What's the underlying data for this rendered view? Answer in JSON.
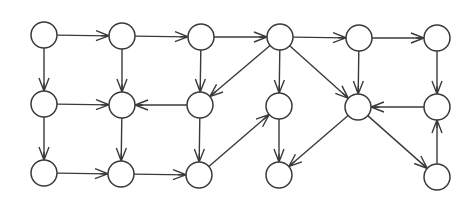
{
  "diagram": {
    "type": "directed-graph",
    "node_radius": 13,
    "colors": {
      "stroke": "#3a3a3a",
      "fill": "#ffffff",
      "background": "#ffffff"
    },
    "nodes": [
      {
        "id": "A",
        "x": 44,
        "y": 35
      },
      {
        "id": "B",
        "x": 122,
        "y": 36
      },
      {
        "id": "C",
        "x": 201,
        "y": 37
      },
      {
        "id": "D",
        "x": 280,
        "y": 37
      },
      {
        "id": "E",
        "x": 359,
        "y": 38
      },
      {
        "id": "F",
        "x": 437,
        "y": 38
      },
      {
        "id": "G",
        "x": 44,
        "y": 104
      },
      {
        "id": "H",
        "x": 122,
        "y": 105
      },
      {
        "id": "I",
        "x": 200,
        "y": 105
      },
      {
        "id": "J",
        "x": 279,
        "y": 106
      },
      {
        "id": "K",
        "x": 358,
        "y": 107
      },
      {
        "id": "L",
        "x": 437,
        "y": 107
      },
      {
        "id": "M",
        "x": 44,
        "y": 173
      },
      {
        "id": "N",
        "x": 121,
        "y": 174
      },
      {
        "id": "O",
        "x": 199,
        "y": 175
      },
      {
        "id": "P",
        "x": 279,
        "y": 175
      },
      {
        "id": "Q",
        "x": 437,
        "y": 177
      }
    ],
    "edges": [
      {
        "from": "A",
        "to": "B"
      },
      {
        "from": "B",
        "to": "C"
      },
      {
        "from": "C",
        "to": "D"
      },
      {
        "from": "D",
        "to": "E"
      },
      {
        "from": "E",
        "to": "F"
      },
      {
        "from": "A",
        "to": "G"
      },
      {
        "from": "B",
        "to": "H"
      },
      {
        "from": "C",
        "to": "I"
      },
      {
        "from": "D",
        "to": "J"
      },
      {
        "from": "E",
        "to": "K"
      },
      {
        "from": "F",
        "to": "L"
      },
      {
        "from": "G",
        "to": "H"
      },
      {
        "from": "I",
        "to": "H"
      },
      {
        "from": "D",
        "to": "I"
      },
      {
        "from": "D",
        "to": "K"
      },
      {
        "from": "L",
        "to": "K"
      },
      {
        "from": "G",
        "to": "M"
      },
      {
        "from": "H",
        "to": "N"
      },
      {
        "from": "I",
        "to": "O"
      },
      {
        "from": "J",
        "to": "P"
      },
      {
        "from": "K",
        "to": "P"
      },
      {
        "from": "K",
        "to": "Q"
      },
      {
        "from": "Q",
        "to": "L"
      },
      {
        "from": "M",
        "to": "N"
      },
      {
        "from": "N",
        "to": "O"
      },
      {
        "from": "O",
        "to": "J"
      }
    ]
  }
}
